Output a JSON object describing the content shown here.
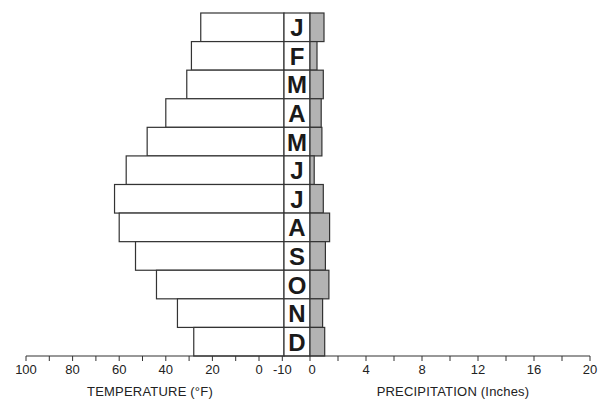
{
  "chart_data": {
    "type": "bar",
    "subtype": "back-to-back horizontal bar (climograph)",
    "categories": [
      "J",
      "F",
      "M",
      "A",
      "M",
      "J",
      "J",
      "A",
      "S",
      "O",
      "N",
      "D"
    ],
    "series": [
      {
        "name": "Temperature (°F)",
        "values": [
          25,
          29,
          31,
          40,
          48,
          57,
          62,
          60,
          53,
          44,
          35,
          28
        ],
        "color": "#ffffff",
        "direction": "left"
      },
      {
        "name": "Precipitation (Inches)",
        "values": [
          1.0,
          0.5,
          0.95,
          0.8,
          0.85,
          0.3,
          0.95,
          1.4,
          1.1,
          1.35,
          0.9,
          1.05
        ],
        "color": "#b3b3b3",
        "direction": "right"
      }
    ],
    "xlabel_left": "TEMPERATURE (°F)",
    "xlabel_right": "PRECIPITATION (Inches)",
    "temperature_ticks": [
      "100",
      "80",
      "60",
      "40",
      "20",
      "0",
      "-10"
    ],
    "precipitation_ticks": [
      "0",
      "4",
      "8",
      "12",
      "16",
      "20"
    ],
    "temperature_range": [
      -10,
      100
    ],
    "precipitation_range": [
      0,
      20
    ],
    "grid": false,
    "legend": "none"
  },
  "axis": {
    "temp_title": "TEMPERATURE (°F)",
    "precip_title": "PRECIPITATION (Inches)"
  }
}
